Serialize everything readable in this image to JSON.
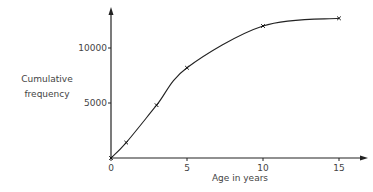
{
  "chart_data": {
    "type": "line",
    "title": "",
    "xlabel": "Age in years",
    "ylabel": "Cumulative frequency",
    "ylabel_lines": [
      "Cumulative",
      "frequency"
    ],
    "x_ticks": [
      0,
      5,
      10,
      15
    ],
    "y_ticks": [
      5000,
      10000
    ],
    "x_tick_labels": [
      "0",
      "5",
      "10",
      "15"
    ],
    "y_tick_labels": [
      "5000",
      "10000"
    ],
    "xlim": [
      0,
      16
    ],
    "ylim": [
      0,
      13000
    ],
    "grid": false,
    "legend": null,
    "series": [
      {
        "name": "Cumulative frequency",
        "marker": "x",
        "x": [
          0,
          1,
          3,
          5,
          10,
          15
        ],
        "values": [
          0,
          1400,
          4800,
          8200,
          12000,
          12700
        ]
      }
    ]
  }
}
